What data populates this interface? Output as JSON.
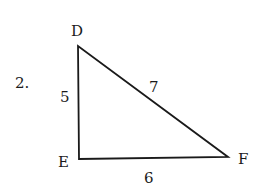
{
  "problem": {
    "number": "2."
  },
  "triangle": {
    "vertices": [
      {
        "name": "D",
        "x": 78,
        "y": 46
      },
      {
        "name": "E",
        "x": 79,
        "y": 159
      },
      {
        "name": "F",
        "x": 228,
        "y": 157
      }
    ],
    "labels": {
      "D": "D",
      "E": "E",
      "F": "F"
    },
    "sides": {
      "DE": "5",
      "DF": "7",
      "EF": "6"
    },
    "stroke_color": "#1a1a1a"
  }
}
